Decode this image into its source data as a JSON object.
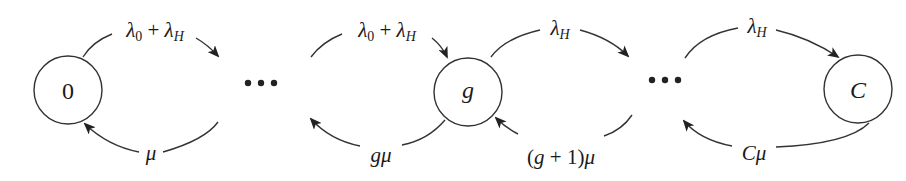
{
  "diagram": {
    "type": "birth-death Markov chain (state transition diagram)",
    "colors": {
      "stroke": "#333333",
      "text": "#1a1a1a",
      "background": "#ffffff"
    },
    "nodes": [
      {
        "id": "0",
        "label": "0"
      },
      {
        "id": "g",
        "label": "g"
      },
      {
        "id": "C",
        "label": "C"
      }
    ],
    "ellipses": [
      {
        "between": [
          "0",
          "g"
        ],
        "label": "•••"
      },
      {
        "between": [
          "g",
          "C"
        ],
        "label": "•••"
      }
    ],
    "edges": [
      {
        "from": "0",
        "to": "…",
        "direction": "forward",
        "rate": {
          "base": "λ",
          "sub": "0",
          "plus": " + ",
          "base2": "λ",
          "sub2": "H"
        }
      },
      {
        "from": "…",
        "to": "0",
        "direction": "backward",
        "rate": {
          "text": "μ"
        }
      },
      {
        "from": "…",
        "to": "g",
        "direction": "forward",
        "rate": {
          "base": "λ",
          "sub": "0",
          "plus": " + ",
          "base2": "λ",
          "sub2": "H"
        }
      },
      {
        "from": "g",
        "to": "…",
        "direction": "backward",
        "rate": {
          "text": "gμ"
        }
      },
      {
        "from": "g",
        "to": "…",
        "direction": "forward",
        "rate": {
          "base": "λ",
          "sub": "H"
        }
      },
      {
        "from": "…",
        "to": "g",
        "direction": "backward",
        "rate": {
          "open": "(",
          "var": "g",
          "mid": " + 1",
          "close": ")",
          "mu": "μ"
        }
      },
      {
        "from": "…",
        "to": "C",
        "direction": "forward",
        "rate": {
          "base": "λ",
          "sub": "H"
        }
      },
      {
        "from": "C",
        "to": "…",
        "direction": "backward",
        "rate": {
          "text": "Cμ"
        }
      }
    ]
  }
}
